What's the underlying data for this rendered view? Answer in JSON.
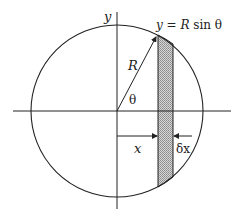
{
  "diagram": {
    "labels": {
      "y_axis": "y",
      "formula": "y = R sin θ",
      "formula_y": "y",
      "formula_eq": " = ",
      "formula_R": "R",
      "formula_rest": " sin θ",
      "radius": "R",
      "angle": "θ",
      "x_distance": "x",
      "strip_width": "δx"
    },
    "colors": {
      "stroke": "#222222",
      "strip_fill": "#bdbdbd",
      "background": "#ffffff"
    }
  }
}
